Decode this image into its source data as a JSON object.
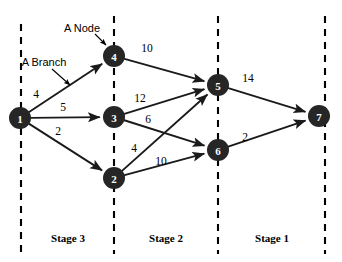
{
  "figure": {
    "type": "network-diagram",
    "title": "",
    "background_color": "#ffffff",
    "node_color": "#262626",
    "node_text_color": "#ffffff",
    "branch_color": "#1a1a1a"
  },
  "nodes": [
    {
      "id": "1",
      "label": "1",
      "x": 20,
      "y": 118,
      "r": 11
    },
    {
      "id": "2",
      "label": "2",
      "x": 114,
      "y": 178,
      "r": 11
    },
    {
      "id": "3",
      "label": "3",
      "x": 114,
      "y": 117,
      "r": 11
    },
    {
      "id": "4",
      "label": "4",
      "x": 114,
      "y": 56,
      "r": 11
    },
    {
      "id": "5",
      "label": "5",
      "x": 218,
      "y": 85,
      "r": 11
    },
    {
      "id": "6",
      "label": "6",
      "x": 218,
      "y": 150,
      "r": 11
    },
    {
      "id": "7",
      "label": "7",
      "x": 319,
      "y": 116,
      "r": 11
    }
  ],
  "edges": [
    {
      "from": "1",
      "to": "4",
      "weight": "4",
      "label_x": 36,
      "label_y": 94
    },
    {
      "from": "1",
      "to": "3",
      "weight": "5",
      "label_x": 63,
      "label_y": 107
    },
    {
      "from": "1",
      "to": "2",
      "weight": "2",
      "label_x": 58,
      "label_y": 131
    },
    {
      "from": "4",
      "to": "5",
      "weight": "10",
      "label_x": 147,
      "label_y": 48
    },
    {
      "from": "3",
      "to": "5",
      "weight": "12",
      "label_x": 140,
      "label_y": 98
    },
    {
      "from": "3",
      "to": "6",
      "weight": "6",
      "label_x": 148,
      "label_y": 119
    },
    {
      "from": "2",
      "to": "5",
      "weight": "4",
      "label_x": 134,
      "label_y": 148
    },
    {
      "from": "2",
      "to": "6",
      "weight": "10",
      "label_x": 161,
      "label_y": 161
    },
    {
      "from": "5",
      "to": "7",
      "weight": "14",
      "label_x": 248,
      "label_y": 78
    },
    {
      "from": "6",
      "to": "7",
      "weight": "2",
      "label_x": 245,
      "label_y": 137
    }
  ],
  "stage_dividers": [
    {
      "x": 21,
      "y1": 24,
      "y2": 254
    },
    {
      "x": 114,
      "y1": 16,
      "y2": 254
    },
    {
      "x": 218,
      "y1": 16,
      "y2": 254
    },
    {
      "x": 325,
      "y1": 16,
      "y2": 254
    }
  ],
  "stage_labels": [
    {
      "text": "Stage 3",
      "x": 68,
      "y": 238
    },
    {
      "text": "Stage 2",
      "x": 166,
      "y": 238
    },
    {
      "text": "Stage 1",
      "x": 272,
      "y": 238
    }
  ],
  "annotations": [
    {
      "name": "a-node",
      "text": "A Node",
      "text_x": 82,
      "text_y": 28,
      "leader": {
        "x1": 95,
        "y1": 34,
        "x2": 106,
        "y2": 45
      }
    },
    {
      "name": "a-branch",
      "text": "A Branch",
      "text_x": 44,
      "text_y": 62,
      "leader": {
        "x1": 52,
        "y1": 69,
        "x2": 70,
        "y2": 85
      }
    }
  ]
}
